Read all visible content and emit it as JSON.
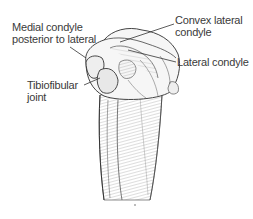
{
  "figure": {
    "labels": [
      {
        "id": "medial-condyle",
        "lines": [
          "Medial condyle",
          "posterior to lateral"
        ]
      },
      {
        "id": "convex-lateral-condyle",
        "lines": [
          "Convex lateral",
          "condyle"
        ]
      },
      {
        "id": "lateral-condyle",
        "lines": [
          "Lateral condyle"
        ]
      },
      {
        "id": "tibiofibular-joint",
        "lines": [
          "Tibiofibular",
          "joint"
        ]
      }
    ],
    "colors": {
      "text": "#3a3a3a",
      "line": "#333333",
      "bone_fill": "#f4f4f4",
      "shade": "#8a8a8a"
    }
  }
}
